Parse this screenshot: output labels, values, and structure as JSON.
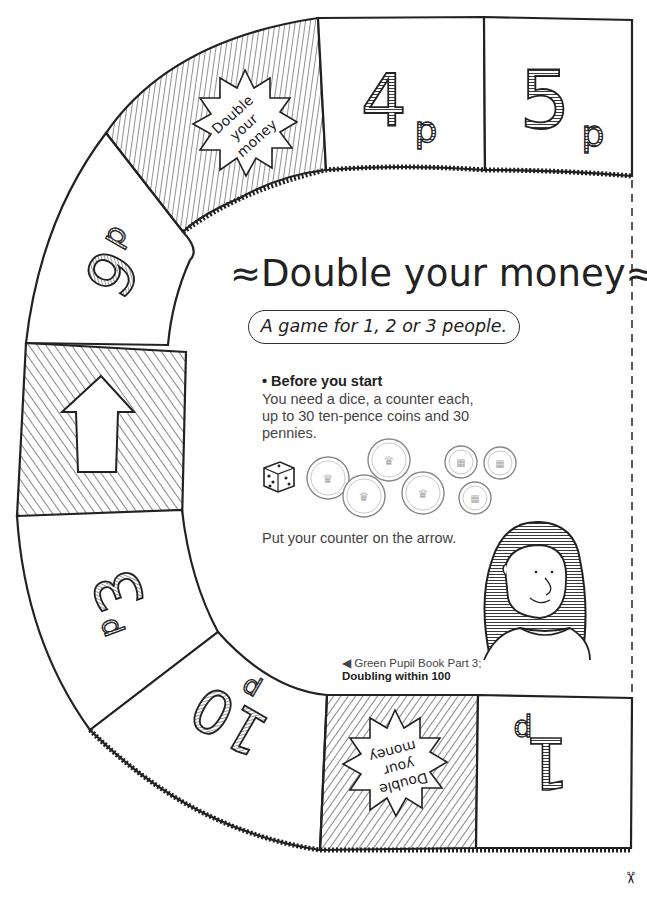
{
  "game": {
    "title": "≈Double your money≈",
    "subtitle": "A game for 1, 2 or 3 people.",
    "instructions": {
      "heading": "• Before you start",
      "needs_text": "You need a dice, a counter each, up to 30 ten-pence coins and 30 pennies.",
      "start_text": "Put your counter on the arrow."
    },
    "reference": {
      "line1": "◀ Green Pupil Book Part 3;",
      "line2": "Doubling within 100"
    }
  },
  "board": {
    "squares": [
      {
        "id": "start",
        "label": "",
        "icon": "up-arrow-icon",
        "style": "hatched"
      },
      {
        "id": "9p",
        "label": "9",
        "unit": "p"
      },
      {
        "id": "double-top",
        "label": "Double your money",
        "style": "hatched-starburst"
      },
      {
        "id": "4p",
        "label": "4",
        "unit": "p"
      },
      {
        "id": "5p",
        "label": "5",
        "unit": "p"
      },
      {
        "id": "1p",
        "label": "1",
        "unit": "p",
        "rotated": true
      },
      {
        "id": "double-bottom",
        "label": "Double your money",
        "style": "hatched-starburst",
        "rotated": true
      },
      {
        "id": "10p",
        "label": "10",
        "unit": "p",
        "rotated": true
      },
      {
        "id": "3p",
        "label": "3",
        "unit": "p",
        "rotated": true
      }
    ],
    "starburst_text": [
      "Double",
      "your",
      "money"
    ]
  },
  "props": {
    "dice_icon": "dice-icon",
    "ten_pence_coins": 4,
    "penny_coins": 3
  },
  "cut_marker": "✂",
  "colors": {
    "ink": "#222222",
    "text_gray": "#444444",
    "background": "#ffffff"
  }
}
